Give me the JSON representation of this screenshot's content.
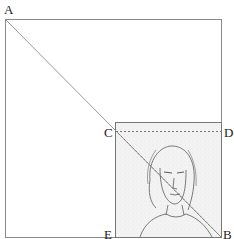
{
  "figure": {
    "labels": {
      "A": "A",
      "B": "B",
      "C": "C",
      "D": "D",
      "E": "E"
    },
    "colors": {
      "line": "#8a8a8a",
      "sketch": "#6b6b6b",
      "paper": "#f4f4f4"
    }
  }
}
